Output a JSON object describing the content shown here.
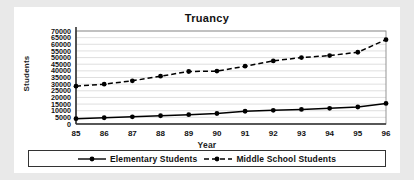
{
  "chart_data": {
    "type": "line",
    "title": "Truancy",
    "xlabel": "Year",
    "ylabel": "Students",
    "grid": true,
    "legend_position": "bottom",
    "x": [
      "85",
      "86",
      "87",
      "88",
      "89",
      "90",
      "91",
      "92",
      "93",
      "94",
      "95",
      "96"
    ],
    "categories": [
      "85",
      "86",
      "87",
      "88",
      "89",
      "90",
      "91",
      "92",
      "93",
      "94",
      "95",
      "96"
    ],
    "ylim": [
      0,
      70000
    ],
    "ytick_step": 5000,
    "yticks": [
      "70000",
      "65000",
      "60000",
      "55000",
      "50000",
      "45000",
      "40000",
      "35000",
      "30000",
      "25000",
      "20000",
      "15000",
      "10000",
      "5000",
      "0"
    ],
    "series": [
      {
        "name": "Elementary Students",
        "style": "solid",
        "marker": "circle",
        "color": "#000000",
        "values": [
          4000,
          4700,
          5400,
          6200,
          7000,
          7900,
          9600,
          10300,
          11000,
          11800,
          12800,
          15500
        ]
      },
      {
        "name": "Middle School Students",
        "style": "dashed",
        "marker": "circle",
        "color": "#000000",
        "values": [
          28500,
          30000,
          32500,
          36000,
          39500,
          39800,
          43500,
          47500,
          50000,
          51500,
          54000,
          63500
        ]
      }
    ]
  },
  "legend": {
    "entries": [
      {
        "label": "Elementary Students"
      },
      {
        "label": "Middle School Students"
      }
    ]
  }
}
